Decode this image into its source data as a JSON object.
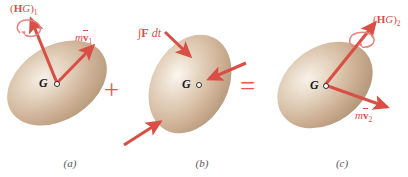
{
  "figure": {
    "background_color": "#ffffff",
    "vector_color": "#d94f46",
    "body_color": "#cdb49a",
    "body_highlight": "#f3ece2",
    "operators": {
      "plus": "+",
      "equals": "="
    }
  },
  "panels": [
    {
      "id": "a",
      "caption": "(a)",
      "center_label": "G",
      "body": {
        "name": "rigid-body-ellipse",
        "tilt_deg": -32,
        "width": 108,
        "height": 74
      },
      "vectors": [
        {
          "name": "angular-momentum-vector",
          "label_html": "(<b>H</b><i>G</i>)<sub>1</sub>",
          "label_text": "(H_G)_1",
          "has_spin_arc": true
        },
        {
          "name": "linear-momentum-vector",
          "label_html": "<i>m</i><b>v</b><sub>1</sub>",
          "label_text": "m v_1",
          "has_spin_arc": false
        }
      ]
    },
    {
      "id": "b",
      "caption": "(b)",
      "center_label": "G",
      "body": {
        "name": "rigid-body-ellipse",
        "tilt_deg": -62,
        "width": 104,
        "height": 76
      },
      "vectors": [
        {
          "name": "impulse-vector-upper-left",
          "label_html": "&#8747;<b>F</b> <i>dt</i>",
          "label_text": "∫F dt",
          "has_spin_arc": false
        },
        {
          "name": "impulse-vector-right",
          "label_html": "",
          "label_text": "",
          "has_spin_arc": false
        },
        {
          "name": "impulse-vector-lower-left",
          "label_html": "",
          "label_text": "",
          "has_spin_arc": false
        }
      ]
    },
    {
      "id": "c",
      "caption": "(c)",
      "center_label": "G",
      "body": {
        "name": "rigid-body-ellipse",
        "tilt_deg": -36,
        "width": 104,
        "height": 76
      },
      "vectors": [
        {
          "name": "angular-momentum-vector",
          "label_html": "(<b>H</b><i>G</i>)<sub>2</sub>",
          "label_text": "(H_G)_2",
          "has_spin_arc": true
        },
        {
          "name": "linear-momentum-vector",
          "label_html": "<i>m</i><b>v</b><sub>2</sub>",
          "label_text": "m v_2",
          "has_spin_arc": false
        }
      ]
    }
  ]
}
